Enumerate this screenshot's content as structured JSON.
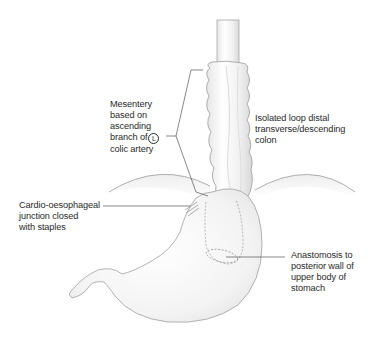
{
  "figure": {
    "colors": {
      "organ_fill": "#f4f4f4",
      "organ_outline": "#9a9a9a",
      "leader_line": "#555555",
      "text": "#2a2a2a"
    }
  },
  "labels": {
    "mesentery": {
      "line1": "Mesentery",
      "line2": "based on",
      "line3": "ascending",
      "line4_prefix": "branch of",
      "line4_circled": "L",
      "line5": "colic artery"
    },
    "isolated_loop": {
      "line1": "Isolated loop distal",
      "line2": "transverse/descending",
      "line3": "colon"
    },
    "cardio_junction": {
      "line1": "Cardio-oesophageal",
      "line2": "junction closed",
      "line3": "with staples"
    },
    "anastomosis": {
      "line1": "Anastomosis to",
      "line2": "posterior wall of",
      "line3": "upper body of",
      "line4": "stomach"
    }
  }
}
